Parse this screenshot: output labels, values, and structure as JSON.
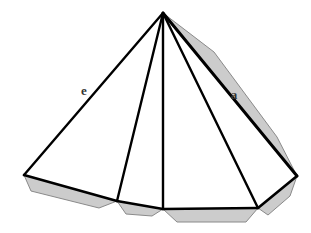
{
  "figure": {
    "background_color": "#ffffff",
    "stroke_color": "#000000",
    "fill_color": "#ffffff",
    "shade_color": "#cccccc",
    "shade_stroke_color": "#808080",
    "labels": {
      "lateral_edge": "e",
      "base_edge": "a"
    },
    "label_positions": {
      "lateral_edge": {
        "x": 84,
        "y": 95
      },
      "base_edge": {
        "x": 234,
        "y": 99
      }
    },
    "geometry": {
      "apex": {
        "x": 163,
        "y": 13
      },
      "base_vertices": [
        {
          "name": "left",
          "x": 24,
          "y": 175
        },
        {
          "name": "front-left",
          "x": 117,
          "y": 201
        },
        {
          "name": "front-center",
          "x": 163,
          "y": 209
        },
        {
          "name": "front-right",
          "x": 258,
          "y": 208
        },
        {
          "name": "right",
          "x": 297,
          "y": 176
        }
      ],
      "lateral_edges": [
        "apex-left",
        "apex-front-left",
        "apex-front-center",
        "apex-front-right",
        "apex-right"
      ],
      "shaded_faces": [
        "right-slant-band",
        "base-left-strip",
        "base-center-left-strip",
        "base-center-right-strip",
        "base-right-strip"
      ]
    },
    "paths": {
      "outline": "M 163 13 L 24 175 L 117 201 L 163 209 L 258 208 L 297 176 Z",
      "shade_band_right": "M 163 13 L 214 52 L 277 137 L 297 176 Z",
      "shade_base_left": "M 24 175 L 31 191 L 99 208 L 117 201 Z",
      "shade_base_center_left": "M 117 201 L 126 214 L 152 216 L 163 209 Z",
      "shade_base_center_right": "M 163 209 L 177 222 L 246 222 L 258 208 Z",
      "shade_base_right": "M 258 208 L 268 215 L 290 196 L 297 176 Z",
      "spoke_left": "M 163 13 L 24 175",
      "spoke_front_left": "M 163 13 L 117 201",
      "spoke_front_center": "M 163 13 L 163 209",
      "spoke_front_right": "M 163 13 L 258 208",
      "spoke_right": "M 163 13 L 297 176",
      "base_left": "M 24 175 L 117 201",
      "base_center_left": "M 117 201 L 163 209",
      "base_center_right": "M 163 209 L 258 208",
      "base_right": "M 258 208 L 297 176"
    }
  }
}
